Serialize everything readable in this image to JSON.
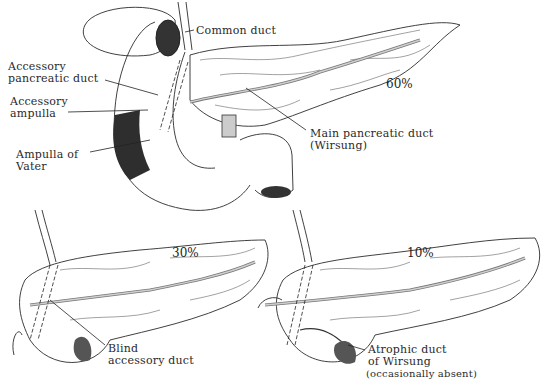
{
  "figure": {
    "panels": [
      {
        "id": "main",
        "percentage": "60%",
        "labels": {
          "common_duct": "Common duct",
          "accessory_pancreatic_duct_1": "Accessory",
          "accessory_pancreatic_duct_2": "pancreatic duct",
          "accessory_ampulla_1": "Accessory",
          "accessory_ampulla_2": "ampulla",
          "ampulla_of_vater_1": "Ampulla of",
          "ampulla_of_vater_2": "Vater",
          "main_duct_1": "Main pancreatic duct",
          "main_duct_2": "(Wirsung)"
        }
      },
      {
        "id": "lower-left",
        "percentage": "30%",
        "labels": {
          "blind_accessory_1": "Blind",
          "blind_accessory_2": "accessory duct"
        }
      },
      {
        "id": "lower-right",
        "percentage": "10%",
        "labels": {
          "atrophic_1": "Atrophic duct",
          "atrophic_2": "of Wirsung",
          "atrophic_3": "(occasionally absent)"
        }
      }
    ],
    "colors": {
      "ink": "#2b2b2b",
      "background": "#ffffff",
      "shade": "#3a3a3a"
    }
  }
}
